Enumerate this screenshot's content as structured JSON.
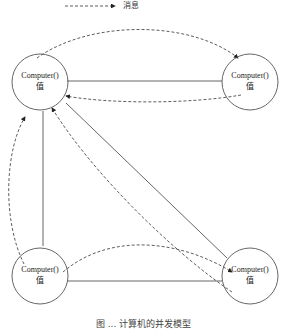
{
  "legend": {
    "dashed_arrow_label": "消息"
  },
  "nodes": [
    {
      "id": "top-left",
      "line1": "Computer()",
      "line2": "值"
    },
    {
      "id": "top-right",
      "line1": "Computer()",
      "line2": "值"
    },
    {
      "id": "bottom-left",
      "line1": "Computer()",
      "line2": "值"
    },
    {
      "id": "bottom-right",
      "line1": "Computer()",
      "line2": "值"
    }
  ],
  "edges": {
    "solid": [
      {
        "from": "top-left",
        "to": "top-right"
      },
      {
        "from": "top-left",
        "to": "bottom-left"
      },
      {
        "from": "top-left",
        "to": "bottom-right"
      },
      {
        "from": "bottom-left",
        "to": "bottom-right"
      }
    ],
    "dashed_messages": [
      {
        "from": "top-left",
        "to": "top-right"
      },
      {
        "from": "top-right",
        "to": "top-left"
      },
      {
        "from": "bottom-left",
        "to": "top-left"
      },
      {
        "from": "bottom-right",
        "to": "top-left"
      },
      {
        "from": "bottom-left",
        "to": "bottom-right"
      }
    ]
  },
  "caption": "图 ... 计算机的并发模型"
}
